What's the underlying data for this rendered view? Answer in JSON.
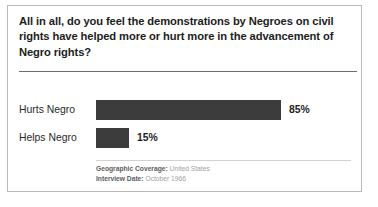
{
  "card": {
    "question": "All in all, do you feel the demonstrations by Negroes on civil rights have helped more or hurt more in the advancement of Negro rights?"
  },
  "footer": {
    "geographic_coverage_key": "Geographic Coverage:",
    "geographic_coverage_value": "United States",
    "interview_date_key": "Interview Date:",
    "interview_date_value": "October 1966"
  },
  "colors": {
    "bar": "#3c3c3c",
    "border": "#b9b9b9",
    "title_rule": "#6d6d6d",
    "footer_rule": "#d2d2d2"
  },
  "chart_data": {
    "type": "bar",
    "orientation": "horizontal",
    "title": "All in all, do you feel the demonstrations by Negroes on civil rights have helped more or hurt more in the advancement of Negro rights?",
    "categories": [
      "Hurts Negro",
      "Helps Negro"
    ],
    "values": [
      85,
      15
    ],
    "value_labels": [
      "85%",
      "15%"
    ],
    "xlabel": "",
    "ylabel": "",
    "xlim": [
      0,
      100
    ],
    "grid": false,
    "legend": false,
    "units": "percent"
  }
}
